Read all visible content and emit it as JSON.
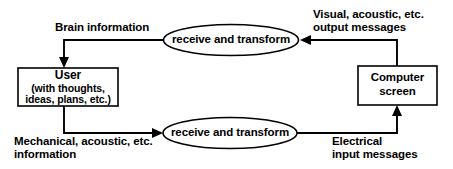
{
  "diagram": {
    "background_color": "#ffffff",
    "line_color": "#000000",
    "nodes": {
      "user": {
        "title": "User",
        "sub_line1": "(with thoughts,",
        "sub_line2": "ideas, plans, etc.)",
        "shape": "rectangle"
      },
      "computer_screen": {
        "line1": "Computer",
        "line2": "screen",
        "shape": "rectangle"
      },
      "process_top": {
        "label": "receive and transform",
        "shape": "ellipse"
      },
      "process_bottom": {
        "label": "receive and transform",
        "shape": "ellipse"
      }
    },
    "edge_labels": {
      "brain_information": "Brain information",
      "visual_output_line1": "Visual, acoustic, etc.",
      "visual_output_line2": "output messages",
      "mechanical_line1": "Mechanical, acoustic, etc.",
      "mechanical_line2": "information",
      "electrical_line1": "Electrical",
      "electrical_line2": "input messages"
    }
  }
}
